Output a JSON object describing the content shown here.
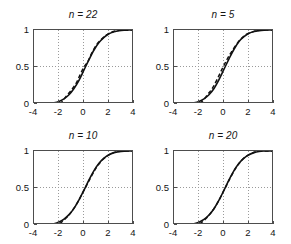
{
  "figure": {
    "width": 291,
    "height": 244,
    "background": "#ffffff",
    "layout": "2x2 grid of subplots"
  },
  "axis_style": {
    "box_color": "#4d4d4d",
    "grid_color": "#9a9a9a",
    "grid": "dotted",
    "solid_curve_color": "#111111",
    "dashed_curve_color": "#111111"
  },
  "chart_data": [
    {
      "type": "line",
      "title": "n = 22",
      "xlabel": "",
      "ylabel": "",
      "xlim": [
        -4,
        4
      ],
      "ylim": [
        0,
        1
      ],
      "xticks": [
        -4,
        -2,
        0,
        2,
        4
      ],
      "xticklabels": [
        "-4",
        "-2",
        "0",
        "2",
        "4"
      ],
      "yticks": [
        0,
        0.5,
        1
      ],
      "yticklabels": [
        "0",
        "0.5",
        "1"
      ],
      "grid": true,
      "legend": "none",
      "series": [
        {
          "name": "theoretical normal CDF",
          "style": "solid",
          "x": [
            -4,
            -3.6,
            -3.2,
            -2.8,
            -2.4,
            -2,
            -1.6,
            -1.2,
            -0.8,
            -0.4,
            0,
            0.4,
            0.8,
            1.2,
            1.6,
            2,
            2.4,
            2.8,
            3.2,
            3.6,
            4
          ],
          "y": [
            0.0,
            0.0,
            0.002,
            0.006,
            0.016,
            0.035,
            0.07,
            0.125,
            0.21,
            0.32,
            0.46,
            0.6,
            0.73,
            0.83,
            0.9,
            0.95,
            0.975,
            0.99,
            0.997,
            0.999,
            1.0
          ]
        },
        {
          "name": "empirical CDF",
          "style": "dashed",
          "x": [
            -4,
            -3.2,
            -2.4,
            -1.9,
            -1.4,
            -1.0,
            -0.6,
            -0.3,
            0.0,
            0.3,
            0.6,
            1.0,
            1.5,
            2.0,
            2.6,
            3.2,
            4
          ],
          "y": [
            0.0,
            0.0,
            0.005,
            0.01,
            0.11,
            0.19,
            0.29,
            0.4,
            0.5,
            0.57,
            0.68,
            0.8,
            0.89,
            0.955,
            0.99,
            1.0,
            1.0
          ]
        }
      ]
    },
    {
      "type": "line",
      "title": "n = 5",
      "xlabel": "",
      "ylabel": "",
      "xlim": [
        -4,
        4
      ],
      "ylim": [
        0,
        1
      ],
      "xticks": [
        -4,
        -2,
        0,
        2,
        4
      ],
      "xticklabels": [
        "-4",
        "-2",
        "0",
        "2",
        "4"
      ],
      "yticks": [
        0,
        0.5,
        1
      ],
      "yticklabels": [
        "0",
        "0.5",
        "1"
      ],
      "grid": true,
      "legend": "none",
      "series": [
        {
          "name": "theoretical normal CDF",
          "style": "solid",
          "x": [
            -4,
            -3.6,
            -3.2,
            -2.8,
            -2.4,
            -2,
            -1.6,
            -1.2,
            -0.8,
            -0.4,
            0,
            0.4,
            0.8,
            1.2,
            1.6,
            2,
            2.4,
            2.8,
            3.2,
            3.6,
            4
          ],
          "y": [
            0.0,
            0.0,
            0.002,
            0.006,
            0.016,
            0.035,
            0.07,
            0.125,
            0.21,
            0.33,
            0.47,
            0.61,
            0.74,
            0.845,
            0.91,
            0.955,
            0.98,
            0.992,
            0.998,
            1.0,
            1.0
          ]
        },
        {
          "name": "empirical CDF",
          "style": "dashed",
          "x": [
            -4,
            -3.2,
            -2.4,
            -1.8,
            -1.3,
            -0.9,
            -0.5,
            -0.1,
            0.3,
            0.7,
            1.2,
            1.7,
            2.3,
            3.0,
            4
          ],
          "y": [
            0.0,
            0.0,
            0.01,
            0.03,
            0.13,
            0.22,
            0.35,
            0.49,
            0.62,
            0.73,
            0.85,
            0.93,
            0.975,
            1.0,
            1.0
          ]
        }
      ]
    },
    {
      "type": "line",
      "title": "n = 10",
      "xlabel": "",
      "ylabel": "",
      "xlim": [
        -4,
        4
      ],
      "ylim": [
        0,
        1
      ],
      "xticks": [
        -4,
        -2,
        0,
        2,
        4
      ],
      "xticklabels": [
        "-4",
        "-2",
        "0",
        "2",
        "4"
      ],
      "yticks": [
        0,
        0.5,
        1
      ],
      "yticklabels": [
        "0",
        "0.5",
        "1"
      ],
      "grid": true,
      "legend": "none",
      "series": [
        {
          "name": "theoretical normal CDF",
          "style": "solid",
          "x": [
            -4,
            -3.6,
            -3.2,
            -2.8,
            -2.4,
            -2,
            -1.6,
            -1.2,
            -0.8,
            -0.4,
            0,
            0.4,
            0.8,
            1.2,
            1.6,
            2,
            2.4,
            2.8,
            3.2,
            3.6,
            4
          ],
          "y": [
            0.0,
            0.0,
            0.002,
            0.006,
            0.017,
            0.04,
            0.08,
            0.14,
            0.225,
            0.34,
            0.47,
            0.61,
            0.735,
            0.835,
            0.905,
            0.95,
            0.978,
            0.992,
            0.998,
            1.0,
            1.0
          ]
        },
        {
          "name": "empirical CDF",
          "style": "dashed",
          "x": [
            -4,
            -3.2,
            -2.4,
            -1.9,
            -1.4,
            -1.0,
            -0.5,
            0.0,
            0.5,
            1.0,
            1.6,
            2.2,
            2.9,
            4
          ],
          "y": [
            0.0,
            0.0,
            0.008,
            0.025,
            0.1,
            0.18,
            0.31,
            0.47,
            0.63,
            0.78,
            0.9,
            0.965,
            0.998,
            1.0
          ]
        }
      ]
    },
    {
      "type": "line",
      "title": "n = 20",
      "xlabel": "",
      "ylabel": "",
      "xlim": [
        -4,
        4
      ],
      "ylim": [
        0,
        1
      ],
      "xticks": [
        -4,
        -2,
        0,
        2,
        4
      ],
      "xticklabels": [
        "-4",
        "-2",
        "0",
        "2",
        "4"
      ],
      "yticks": [
        0,
        0.5,
        1
      ],
      "yticklabels": [
        "0",
        "0.5",
        "1"
      ],
      "grid": true,
      "legend": "none",
      "series": [
        {
          "name": "theoretical normal CDF",
          "style": "solid",
          "x": [
            -4,
            -3.6,
            -3.2,
            -2.8,
            -2.4,
            -2,
            -1.6,
            -1.2,
            -0.8,
            -0.4,
            0,
            0.4,
            0.8,
            1.2,
            1.6,
            2,
            2.4,
            2.8,
            3.2,
            3.6,
            4
          ],
          "y": [
            0.0,
            0.0,
            0.002,
            0.006,
            0.017,
            0.038,
            0.075,
            0.135,
            0.22,
            0.335,
            0.47,
            0.61,
            0.735,
            0.835,
            0.905,
            0.95,
            0.978,
            0.993,
            0.999,
            1.0,
            1.0
          ]
        },
        {
          "name": "empirical CDF",
          "style": "dashed",
          "x": [
            -4,
            -3.2,
            -2.4,
            -1.9,
            -1.4,
            -1.0,
            -0.5,
            0.0,
            0.5,
            1.0,
            1.6,
            2.2,
            2.9,
            4
          ],
          "y": [
            0.0,
            0.0,
            0.007,
            0.022,
            0.095,
            0.175,
            0.305,
            0.47,
            0.635,
            0.785,
            0.905,
            0.968,
            0.999,
            1.0
          ]
        }
      ]
    }
  ],
  "panels": [
    {
      "title": "n = 22"
    },
    {
      "title": "n = 5"
    },
    {
      "title": "n = 10"
    },
    {
      "title": "n = 20"
    }
  ]
}
